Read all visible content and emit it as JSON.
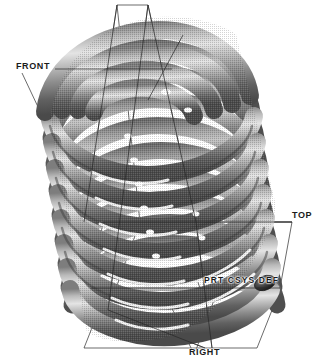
{
  "application": {
    "kind": "cad-3d-viewport",
    "render_mode": "shaded",
    "background_color": "#ffffff"
  },
  "model": {
    "name": "coil-spring",
    "description": "Helical compression coil spring shown in shaded 3D isometric view",
    "coil_turns": 11,
    "axis_tilt_degrees": 14,
    "material_shading": {
      "highlight_color": "#ffffff",
      "light_gray": "#cfcfcf",
      "mid_gray": "#9a9a9a",
      "dark_gray": "#5c5c5c",
      "shadow_color": "#3a3a3a"
    }
  },
  "datum_planes": [
    {
      "id": "front",
      "label": "FRONT",
      "label_x": 16,
      "label_y": 62
    },
    {
      "id": "top",
      "label": "TOP",
      "label_x": 292,
      "label_y": 211
    },
    {
      "id": "right",
      "label": "RIGHT",
      "label_x": 189,
      "label_y": 348
    }
  ],
  "coordinate_system": {
    "label": "PRT CSYS DEF",
    "label_x": 204,
    "label_y": 276
  },
  "geometry": {
    "line_color": "#2b2b2b",
    "line_width": 0.7
  }
}
